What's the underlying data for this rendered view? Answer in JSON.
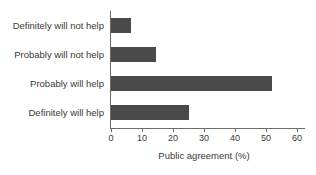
{
  "chart_data": {
    "type": "bar",
    "orientation": "horizontal",
    "title": "",
    "xlabel": "Public agreement (%)",
    "ylabel": "",
    "xlim": [
      0,
      60
    ],
    "xticks": [
      "0",
      "10",
      "20",
      "30",
      "40",
      "50",
      "60"
    ],
    "grid": false,
    "legend": null,
    "bar_color": "#4a4a4a",
    "axis_color": "#6e6b69",
    "background": "#ffffff",
    "categories": [
      "Definitely will not help",
      "Probably will not help",
      "Probably will help",
      "Definitely will help"
    ],
    "values": [
      6.5,
      14.5,
      52,
      25
    ]
  }
}
